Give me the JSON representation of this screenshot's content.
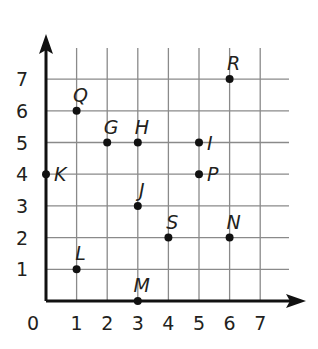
{
  "graph": {
    "type": "coordinate-grid",
    "origin_label": "0",
    "x_ticks": [
      "1",
      "2",
      "3",
      "4",
      "5",
      "6",
      "7"
    ],
    "y_ticks": [
      "1",
      "2",
      "3",
      "4",
      "5",
      "6",
      "7"
    ],
    "colors": {
      "axis": "#111111",
      "grid": "#8a8a8a",
      "point": "#111111",
      "text": "#231f20"
    },
    "points": [
      {
        "label": "Q",
        "x": 1,
        "y": 6,
        "label_pos": "above"
      },
      {
        "label": "G",
        "x": 2,
        "y": 5,
        "label_pos": "above"
      },
      {
        "label": "H",
        "x": 3,
        "y": 5,
        "label_pos": "above"
      },
      {
        "label": "I",
        "x": 5,
        "y": 5,
        "label_pos": "right"
      },
      {
        "label": "R",
        "x": 6,
        "y": 7,
        "label_pos": "above"
      },
      {
        "label": "K",
        "x": 0,
        "y": 4,
        "label_pos": "right"
      },
      {
        "label": "P",
        "x": 5,
        "y": 4,
        "label_pos": "right"
      },
      {
        "label": "J",
        "x": 3,
        "y": 3,
        "label_pos": "above"
      },
      {
        "label": "S",
        "x": 4,
        "y": 2,
        "label_pos": "above"
      },
      {
        "label": "N",
        "x": 6,
        "y": 2,
        "label_pos": "above"
      },
      {
        "label": "L",
        "x": 1,
        "y": 1,
        "label_pos": "above"
      },
      {
        "label": "M",
        "x": 3,
        "y": 0,
        "label_pos": "above"
      }
    ]
  }
}
